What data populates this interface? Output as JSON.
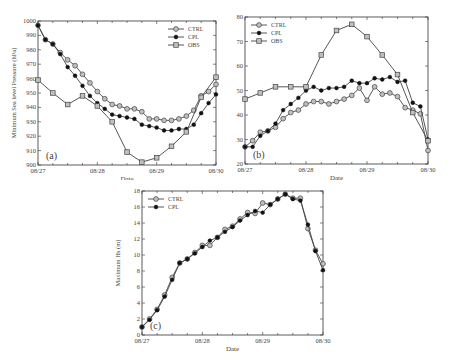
{
  "chart_data": [
    {
      "id": "a",
      "type": "line",
      "panel_label": "(a)",
      "title": "",
      "xlabel": "Date",
      "ylabel": "Minimum Sea level Pressure (hPa)",
      "xticks": [
        "08/27",
        "08/28",
        "08/29",
        "08/30"
      ],
      "yticks": [
        900,
        910,
        920,
        930,
        940,
        950,
        960,
        970,
        980,
        990,
        1000
      ],
      "ylim": [
        900,
        1000
      ],
      "xlim": [
        0,
        3
      ],
      "legend": {
        "position": "upper right",
        "entries": [
          "CTRL",
          "CPL",
          "OBS"
        ]
      },
      "grid": false,
      "series": [
        {
          "name": "CTRL",
          "marker": "open-circle",
          "x_step": 0.125,
          "values": [
            997,
            987,
            984,
            978,
            973,
            969,
            963,
            957,
            951,
            946,
            942,
            941,
            939,
            939,
            937,
            932,
            932,
            931,
            931,
            932,
            934,
            938,
            948,
            951,
            956
          ]
        },
        {
          "name": "CPL",
          "marker": "filled-circle",
          "x_step": 0.125,
          "values": [
            997,
            987,
            984,
            977,
            968,
            962,
            955,
            948,
            943,
            939,
            935,
            934,
            933,
            932,
            928,
            927,
            926,
            924,
            924,
            925,
            925,
            928,
            936,
            943,
            949
          ]
        },
        {
          "name": "OBS",
          "marker": "open-square",
          "x_step": 0.25,
          "values": [
            959,
            950,
            942,
            948,
            941,
            930,
            909,
            902,
            905,
            913,
            923,
            947,
            961
          ]
        }
      ]
    },
    {
      "id": "b",
      "type": "line",
      "panel_label": "(b)",
      "title": "",
      "xlabel": "Date",
      "ylabel": "Maximum 10 m wind speed (m s⁻¹)",
      "xticks": [
        "08/27",
        "08/28",
        "08/29",
        "08/30"
      ],
      "yticks": [
        20,
        30,
        40,
        50,
        60,
        70,
        80
      ],
      "ylim": [
        20,
        80
      ],
      "xlim": [
        0,
        3
      ],
      "legend": {
        "position": "upper left",
        "entries": [
          "CTRL",
          "CPL",
          "OBS"
        ]
      },
      "grid": false,
      "series": [
        {
          "name": "CTRL",
          "marker": "open-circle",
          "x_step": 0.125,
          "values": [
            27,
            29.5,
            33,
            33.5,
            35,
            38.5,
            41,
            42,
            44.5,
            45.5,
            45.5,
            44.5,
            45.5,
            46.5,
            48,
            51,
            46,
            51.5,
            48.5,
            49,
            47.5,
            43,
            42,
            40.5,
            25.5
          ]
        },
        {
          "name": "CPL",
          "marker": "filled-circle",
          "x_step": 0.125,
          "values": [
            27,
            27,
            31.5,
            33.5,
            36.5,
            42,
            44.5,
            47,
            50,
            51.5,
            50,
            51,
            51,
            51.5,
            54,
            53,
            53,
            55,
            54.5,
            55.5,
            53.5,
            54,
            45,
            43.5,
            30
          ]
        },
        {
          "name": "OBS",
          "marker": "open-square",
          "x_step": 0.25,
          "values": [
            46.5,
            49,
            51.5,
            51.5,
            51.5,
            64.5,
            74.5,
            77,
            72,
            64.5,
            56.5,
            41,
            29.5
          ]
        }
      ]
    },
    {
      "id": "c",
      "type": "line",
      "panel_label": "(c)",
      "title": "",
      "xlabel": "Date",
      "ylabel": "Maximum Hs (m)",
      "xticks": [
        "08/27",
        "08/28",
        "08/29",
        "08/30"
      ],
      "yticks": [
        0,
        2,
        4,
        6,
        8,
        10,
        12,
        14,
        16,
        18
      ],
      "ylim": [
        0,
        18
      ],
      "xlim": [
        0,
        3
      ],
      "legend": {
        "position": "upper left",
        "entries": [
          "CTRL",
          "CPL"
        ]
      },
      "grid": false,
      "series": [
        {
          "name": "CTRL",
          "marker": "open-circle",
          "x_step": 0.125,
          "values": [
            1,
            2,
            3.2,
            5,
            7.2,
            9,
            9.5,
            10.3,
            11.2,
            11.2,
            12.2,
            13.2,
            13.6,
            14.5,
            15.3,
            15.2,
            16.5,
            16.3,
            17,
            17.6,
            17.1,
            17.1,
            13.3,
            10.6,
            8.9
          ]
        },
        {
          "name": "CPL",
          "marker": "filled-circle",
          "x_step": 0.125,
          "values": [
            1,
            1.9,
            3.1,
            4.8,
            6.9,
            9,
            9.5,
            10.2,
            11,
            11.8,
            12.2,
            12.9,
            13.5,
            14.3,
            15,
            15.5,
            15.3,
            16.3,
            17,
            17.6,
            17,
            16.8,
            13.8,
            10.5,
            8.1
          ]
        }
      ]
    }
  ],
  "colors": {
    "line": "#444444",
    "axis": "#333333",
    "marker_fill_open": "#bfbfbf",
    "marker_fill_filled": "#111111"
  }
}
